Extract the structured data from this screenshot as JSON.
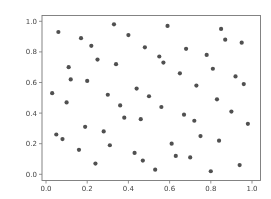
{
  "chart_data": {
    "type": "scatter",
    "title": "",
    "xlabel": "",
    "ylabel": "",
    "xlim": [
      -0.02,
      1.04
    ],
    "ylim": [
      -0.04,
      1.03
    ],
    "grid": false,
    "legend": null,
    "x_ticks": [
      "0.0",
      "0.2",
      "0.4",
      "0.6",
      "0.8",
      "1.0"
    ],
    "y_ticks": [
      "0.0",
      "0.2",
      "0.4",
      "0.6",
      "0.8",
      "1.0"
    ],
    "marker_color": "#505050",
    "series": [
      {
        "name": "points",
        "x": [
          0.06,
          0.17,
          0.22,
          0.25,
          0.11,
          0.12,
          0.2,
          0.03,
          0.3,
          0.33,
          0.59,
          0.4,
          0.48,
          0.55,
          0.57,
          0.34,
          0.65,
          0.44,
          0.5,
          0.85,
          0.87,
          0.95,
          0.68,
          0.78,
          0.81,
          0.92,
          0.96,
          0.73,
          0.83,
          0.1,
          0.19,
          0.28,
          0.05,
          0.08,
          0.31,
          0.16,
          0.24,
          0.36,
          0.56,
          0.38,
          0.46,
          0.61,
          0.43,
          0.63,
          0.47,
          0.53,
          0.9,
          0.67,
          0.72,
          0.98,
          0.75,
          0.84,
          0.7,
          0.94,
          0.8
        ],
        "y": [
          0.93,
          0.89,
          0.84,
          0.75,
          0.7,
          0.62,
          0.61,
          0.53,
          0.52,
          0.98,
          0.97,
          0.91,
          0.83,
          0.77,
          0.73,
          0.72,
          0.66,
          0.56,
          0.51,
          0.95,
          0.88,
          0.86,
          0.82,
          0.78,
          0.69,
          0.64,
          0.59,
          0.58,
          0.49,
          0.47,
          0.31,
          0.28,
          0.26,
          0.23,
          0.19,
          0.16,
          0.07,
          0.45,
          0.44,
          0.37,
          0.36,
          0.2,
          0.14,
          0.12,
          0.09,
          0.03,
          0.41,
          0.39,
          0.35,
          0.33,
          0.25,
          0.22,
          0.11,
          0.06,
          0.02
        ]
      }
    ]
  }
}
